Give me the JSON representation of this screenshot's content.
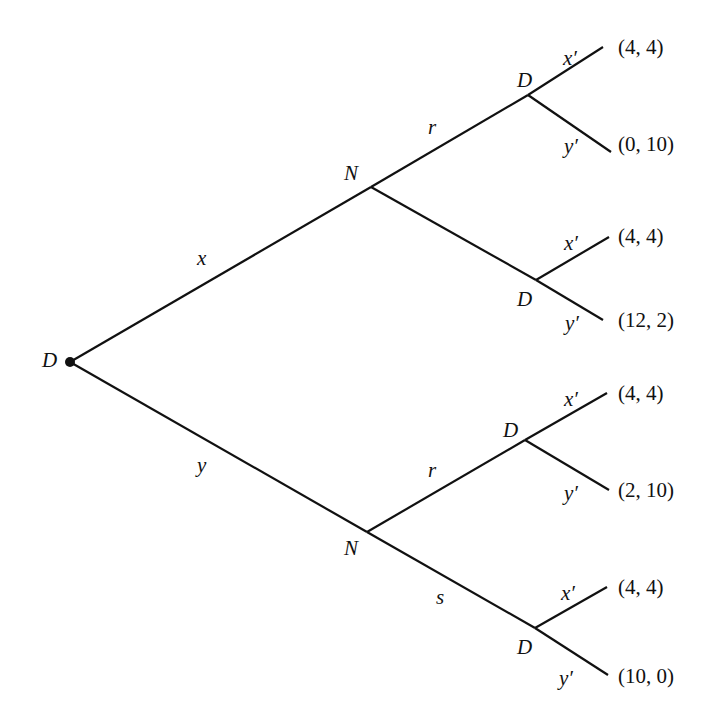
{
  "diagram": {
    "type": "game-tree",
    "root": {
      "player": "D",
      "x": 70,
      "y": 362
    },
    "nodes": [
      {
        "id": "root",
        "player": "D",
        "x": 70,
        "y": 362,
        "label_x": 42,
        "label_y": 350
      },
      {
        "id": "N1",
        "player": "N",
        "x": 371,
        "y": 187,
        "label_x": 344,
        "label_y": 163
      },
      {
        "id": "N2",
        "player": "N",
        "x": 367,
        "y": 532,
        "label_x": 344,
        "label_y": 538
      },
      {
        "id": "D1",
        "player": "D",
        "x": 528,
        "y": 95,
        "label_x": 517,
        "label_y": 70
      },
      {
        "id": "D2",
        "player": "D",
        "x": 536,
        "y": 280,
        "label_x": 517,
        "label_y": 289
      },
      {
        "id": "D3",
        "player": "D",
        "x": 525,
        "y": 440,
        "label_x": 503,
        "label_y": 420
      },
      {
        "id": "D4",
        "player": "D",
        "x": 535,
        "y": 628,
        "label_x": 517,
        "label_y": 637
      }
    ],
    "edges": [
      {
        "from": "root",
        "to": "N1",
        "x1": 70,
        "y1": 362,
        "x2": 371,
        "y2": 187,
        "label": "x",
        "label_x": 197,
        "label_y": 248
      },
      {
        "from": "root",
        "to": "N2",
        "x1": 70,
        "y1": 362,
        "x2": 367,
        "y2": 532,
        "label": "y",
        "label_x": 197,
        "label_y": 455
      },
      {
        "from": "N1",
        "to": "D1",
        "x1": 371,
        "y1": 187,
        "x2": 528,
        "y2": 95,
        "label": "r",
        "label_x": 428,
        "label_y": 117
      },
      {
        "from": "N1",
        "to": "D2",
        "x1": 371,
        "y1": 187,
        "x2": 536,
        "y2": 280,
        "label": "",
        "label_x": 0,
        "label_y": 0
      },
      {
        "from": "N2",
        "to": "D3",
        "x1": 367,
        "y1": 532,
        "x2": 525,
        "y2": 440,
        "label": "r",
        "label_x": 428,
        "label_y": 460
      },
      {
        "from": "N2",
        "to": "D4",
        "x1": 367,
        "y1": 532,
        "x2": 535,
        "y2": 628,
        "label": "s",
        "label_x": 436,
        "label_y": 587
      },
      {
        "from": "D1",
        "to": "T1",
        "x1": 528,
        "y1": 95,
        "x2": 603,
        "y2": 47,
        "label": "x′",
        "label_x": 563,
        "label_y": 48
      },
      {
        "from": "D1",
        "to": "T2",
        "x1": 528,
        "y1": 95,
        "x2": 611,
        "y2": 152,
        "label": "y′",
        "label_x": 564,
        "label_y": 136
      },
      {
        "from": "D2",
        "to": "T3",
        "x1": 536,
        "y1": 280,
        "x2": 609,
        "y2": 237,
        "label": "x′",
        "label_x": 564,
        "label_y": 233
      },
      {
        "from": "D2",
        "to": "T4",
        "x1": 536,
        "y1": 280,
        "x2": 603,
        "y2": 320,
        "label": "y′",
        "label_x": 565,
        "label_y": 313
      },
      {
        "from": "D3",
        "to": "T5",
        "x1": 525,
        "y1": 440,
        "x2": 607,
        "y2": 393,
        "label": "x′",
        "label_x": 564,
        "label_y": 389
      },
      {
        "from": "D3",
        "to": "T6",
        "x1": 525,
        "y1": 440,
        "x2": 609,
        "y2": 490,
        "label": "y′",
        "label_x": 564,
        "label_y": 483
      },
      {
        "from": "D4",
        "to": "T7",
        "x1": 535,
        "y1": 628,
        "x2": 607,
        "y2": 587,
        "label": "x′",
        "label_x": 561,
        "label_y": 583
      },
      {
        "from": "D4",
        "to": "T8",
        "x1": 535,
        "y1": 628,
        "x2": 608,
        "y2": 675,
        "label": "y′",
        "label_x": 559,
        "label_y": 668
      }
    ],
    "terminals": [
      {
        "id": "T1",
        "payoff": "(4, 4)",
        "x": 618,
        "y": 37
      },
      {
        "id": "T2",
        "payoff": "(0, 10)",
        "x": 618,
        "y": 134
      },
      {
        "id": "T3",
        "payoff": "(4, 4)",
        "x": 618,
        "y": 226
      },
      {
        "id": "T4",
        "payoff": "(12, 2)",
        "x": 618,
        "y": 310
      },
      {
        "id": "T5",
        "payoff": "(4, 4)",
        "x": 618,
        "y": 383
      },
      {
        "id": "T6",
        "payoff": "(2, 10)",
        "x": 618,
        "y": 480
      },
      {
        "id": "T7",
        "payoff": "(4, 4)",
        "x": 618,
        "y": 577
      },
      {
        "id": "T8",
        "payoff": "(10, 0)",
        "x": 618,
        "y": 666
      }
    ],
    "colors": {
      "line": "#111111",
      "text": "#111111",
      "background": "#ffffff"
    }
  }
}
